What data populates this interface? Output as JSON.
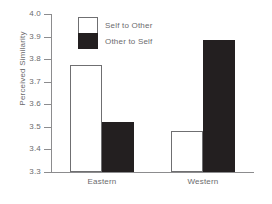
{
  "chart_data": {
    "type": "bar",
    "title": "",
    "subtitle": "",
    "xlabel": "",
    "ylabel": "Perceived Similarity",
    "categories": [
      "Eastern",
      "Western"
    ],
    "series": [
      {
        "name": "Self to Other",
        "color": "#ffffff",
        "values": [
          3.77,
          3.48
        ]
      },
      {
        "name": "Other to Self",
        "color": "#231f20",
        "values": [
          3.52,
          3.88
        ]
      }
    ],
    "ylim": [
      3.3,
      4.0
    ],
    "ytick_labels": [
      "4.0",
      "3.9",
      "3.8",
      "3.7",
      "3.6",
      "3.5",
      "3.4",
      "3.3"
    ],
    "ytick_values": [
      4.0,
      3.9,
      3.8,
      3.7,
      3.6,
      3.5,
      3.4,
      3.3
    ],
    "ytick_step": 0.1,
    "grid": false,
    "legend_position": "top-left-inside",
    "annotations": []
  },
  "legend": {
    "entries": [
      {
        "label": "Self to Other",
        "swatch": "white"
      },
      {
        "label": "Other to Self",
        "swatch": "black"
      }
    ]
  }
}
